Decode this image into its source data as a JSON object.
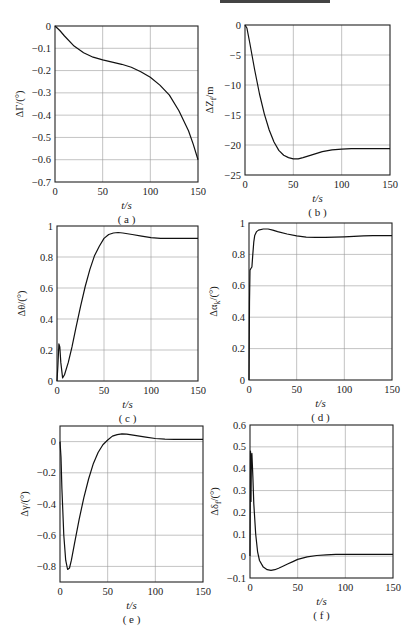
{
  "chart_data": [
    {
      "id": "a",
      "type": "line",
      "caption": "( a )",
      "xlabel": "t/s",
      "ylabel": "ΔΓ/(°)",
      "xlim": [
        0,
        150
      ],
      "ylim": [
        -0.7,
        0
      ],
      "xticks": [
        0,
        50,
        100,
        150
      ],
      "yticks": [
        0,
        -0.1,
        -0.2,
        -0.3,
        -0.4,
        -0.5,
        -0.6,
        -0.7
      ],
      "grid": true,
      "x": [
        0,
        5,
        10,
        20,
        30,
        40,
        50,
        60,
        70,
        80,
        90,
        100,
        110,
        120,
        130,
        140,
        145,
        150
      ],
      "y": [
        0,
        -0.02,
        -0.045,
        -0.09,
        -0.12,
        -0.14,
        -0.152,
        -0.162,
        -0.172,
        -0.185,
        -0.205,
        -0.23,
        -0.265,
        -0.31,
        -0.38,
        -0.47,
        -0.53,
        -0.6
      ]
    },
    {
      "id": "b",
      "type": "line",
      "caption": "( b )",
      "xlabel": "t/s",
      "ylabel": "ΔZ_f/m",
      "xlim": [
        0,
        150
      ],
      "ylim": [
        -25,
        0
      ],
      "xticks": [
        0,
        50,
        100,
        150
      ],
      "yticks": [
        0,
        -5,
        -10,
        -15,
        -20,
        -25
      ],
      "grid": true,
      "x": [
        0,
        2,
        5,
        10,
        15,
        20,
        25,
        30,
        35,
        40,
        45,
        50,
        55,
        60,
        70,
        80,
        90,
        100,
        110,
        120,
        130,
        140,
        150
      ],
      "y": [
        0,
        -0.5,
        -3,
        -7.5,
        -11.5,
        -14.8,
        -17.5,
        -19.5,
        -20.9,
        -21.7,
        -22.1,
        -22.3,
        -22.3,
        -22.1,
        -21.6,
        -21.1,
        -20.8,
        -20.7,
        -20.6,
        -20.6,
        -20.6,
        -20.6,
        -20.6
      ]
    },
    {
      "id": "c",
      "type": "line",
      "caption": "( c )",
      "xlabel": "t/s",
      "ylabel": "Δθ/(°)",
      "xlim": [
        0,
        150
      ],
      "ylim": [
        0,
        1
      ],
      "xticks": [
        0,
        50,
        100,
        150
      ],
      "yticks": [
        0,
        0.2,
        0.4,
        0.6,
        0.8,
        1
      ],
      "grid": true,
      "x": [
        0,
        1,
        2,
        3,
        4,
        6,
        8,
        12,
        16,
        20,
        25,
        30,
        35,
        40,
        45,
        50,
        55,
        60,
        65,
        70,
        80,
        90,
        100,
        110,
        120,
        130,
        140,
        150
      ],
      "y": [
        0,
        0.1,
        0.24,
        0.22,
        0.12,
        0.02,
        0.04,
        0.12,
        0.22,
        0.34,
        0.48,
        0.61,
        0.72,
        0.81,
        0.87,
        0.92,
        0.945,
        0.955,
        0.958,
        0.955,
        0.945,
        0.935,
        0.925,
        0.92,
        0.92,
        0.92,
        0.92,
        0.92
      ]
    },
    {
      "id": "d",
      "type": "line",
      "caption": "( d )",
      "xlabel": "t/s",
      "ylabel": "Δα_k/(°)",
      "xlim": [
        0,
        150
      ],
      "ylim": [
        0,
        1
      ],
      "xticks": [
        0,
        50,
        100,
        150
      ],
      "yticks": [
        0,
        0.2,
        0.4,
        0.6,
        0.8,
        1
      ],
      "grid": true,
      "x": [
        0,
        0.5,
        1,
        2,
        3,
        4,
        5,
        6,
        8,
        10,
        15,
        20,
        25,
        30,
        40,
        50,
        60,
        70,
        80,
        90,
        100,
        110,
        120,
        130,
        140,
        150
      ],
      "y": [
        0,
        0.5,
        0.7,
        0.71,
        0.72,
        0.8,
        0.88,
        0.92,
        0.945,
        0.955,
        0.962,
        0.962,
        0.955,
        0.945,
        0.93,
        0.918,
        0.91,
        0.908,
        0.908,
        0.91,
        0.912,
        0.915,
        0.918,
        0.92,
        0.92,
        0.92
      ]
    },
    {
      "id": "e",
      "type": "line",
      "caption": "( e )",
      "xlabel": "t/s",
      "ylabel": "Δγ/(°)",
      "xlim": [
        0,
        150
      ],
      "ylim": [
        -0.9,
        0.1
      ],
      "xticks": [
        0,
        50,
        100,
        150
      ],
      "yticks": [
        0,
        -0.2,
        -0.4,
        -0.6,
        -0.8
      ],
      "grid": true,
      "x": [
        0,
        1,
        2,
        4,
        6,
        8,
        10,
        12,
        15,
        20,
        25,
        30,
        35,
        40,
        45,
        50,
        55,
        60,
        65,
        70,
        80,
        90,
        100,
        110,
        120,
        130,
        140,
        150
      ],
      "y": [
        0,
        -0.1,
        -0.3,
        -0.6,
        -0.76,
        -0.82,
        -0.81,
        -0.76,
        -0.66,
        -0.5,
        -0.36,
        -0.24,
        -0.14,
        -0.07,
        -0.02,
        0.01,
        0.035,
        0.045,
        0.05,
        0.048,
        0.038,
        0.028,
        0.02,
        0.016,
        0.015,
        0.015,
        0.015,
        0.015
      ]
    },
    {
      "id": "f",
      "type": "line",
      "caption": "( f )",
      "xlabel": "t/s",
      "ylabel": "Δδ_f/(°)",
      "xlim": [
        0,
        150
      ],
      "ylim": [
        -0.1,
        0.6
      ],
      "xticks": [
        0,
        50,
        100,
        150
      ],
      "yticks": [
        0.6,
        0.5,
        0.4,
        0.3,
        0.2,
        0.1,
        0,
        -0.1
      ],
      "grid": true,
      "x": [
        0,
        0.5,
        1,
        1.5,
        2,
        3,
        4,
        6,
        8,
        10,
        14,
        18,
        22,
        26,
        30,
        35,
        40,
        45,
        50,
        60,
        70,
        80,
        90,
        100,
        110,
        120,
        130,
        140,
        150
      ],
      "y": [
        0,
        0.48,
        0.25,
        0.45,
        0.47,
        0.36,
        0.24,
        0.1,
        0.02,
        -0.02,
        -0.05,
        -0.062,
        -0.065,
        -0.062,
        -0.055,
        -0.045,
        -0.035,
        -0.025,
        -0.015,
        -0.003,
        0.003,
        0.006,
        0.008,
        0.008,
        0.008,
        0.008,
        0.008,
        0.008,
        0.008
      ]
    }
  ],
  "layout": {
    "plots": [
      {
        "id": "a",
        "left": 55,
        "top": 26,
        "width": 143,
        "height": 156
      },
      {
        "id": "b",
        "left": 245,
        "top": 25,
        "width": 145,
        "height": 150
      },
      {
        "id": "c",
        "left": 57,
        "top": 226,
        "width": 141,
        "height": 155
      },
      {
        "id": "d",
        "left": 249,
        "top": 223,
        "width": 143,
        "height": 157
      },
      {
        "id": "e",
        "left": 60,
        "top": 426,
        "width": 143,
        "height": 156
      },
      {
        "id": "f",
        "left": 250,
        "top": 425,
        "width": 143,
        "height": 153
      }
    ]
  }
}
